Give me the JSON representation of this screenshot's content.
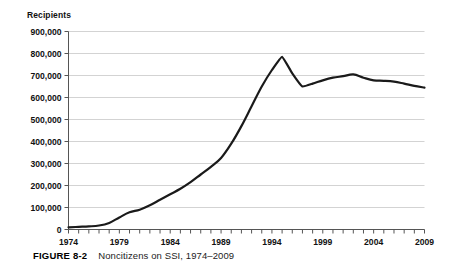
{
  "figure": {
    "caption_label": "FIGURE 8-2",
    "caption_text": "Noncitizens on SSI, 1974–2009"
  },
  "chart_data": {
    "type": "line",
    "title": "",
    "subtitle": "",
    "xlabel": "",
    "ylabel": "Recipients",
    "ylim": [
      0,
      900000
    ],
    "xlim": [
      1974,
      2009
    ],
    "grid": true,
    "grid_axis": "y",
    "legend": false,
    "legend_position": "none",
    "line_color": "#1a1a1a",
    "background_color": "#ffffff",
    "gridline_color": "#c8c8c8",
    "axis_color": "#555555",
    "y_ticks": [
      0,
      100000,
      200000,
      300000,
      400000,
      500000,
      600000,
      700000,
      800000,
      900000
    ],
    "y_tick_labels": [
      "0",
      "100,000",
      "200,000",
      "300,000",
      "400,000",
      "500,000",
      "600,000",
      "700,000",
      "800,000",
      "900,000"
    ],
    "x_ticks": [
      1974,
      1975,
      1976,
      1977,
      1978,
      1979,
      1980,
      1981,
      1982,
      1983,
      1984,
      1985,
      1986,
      1987,
      1988,
      1989,
      1990,
      1991,
      1992,
      1993,
      1994,
      1995,
      1996,
      1997,
      1998,
      1999,
      2000,
      2001,
      2002,
      2003,
      2004,
      2005,
      2006,
      2007,
      2008,
      2009
    ],
    "x_tick_labels_shown": [
      "1974",
      "1979",
      "1984",
      "1989",
      "1994",
      "1999",
      "2004",
      "2009"
    ],
    "x_tick_labels_shown_values": [
      1974,
      1979,
      1984,
      1989,
      1994,
      1999,
      2004,
      2009
    ],
    "x": [
      1974,
      1975,
      1976,
      1977,
      1978,
      1979,
      1980,
      1981,
      1982,
      1983,
      1984,
      1985,
      1986,
      1987,
      1988,
      1989,
      1990,
      1991,
      1992,
      1993,
      1994,
      1995,
      1996,
      1997,
      1998,
      1999,
      2000,
      2001,
      2002,
      2003,
      2004,
      2005,
      2006,
      2007,
      2008,
      2009
    ],
    "values": [
      10000,
      12000,
      14000,
      18000,
      30000,
      55000,
      78000,
      90000,
      110000,
      135000,
      160000,
      185000,
      215000,
      250000,
      285000,
      325000,
      390000,
      470000,
      560000,
      650000,
      725000,
      785000,
      710000,
      650000,
      663000,
      678000,
      690000,
      697000,
      705000,
      690000,
      678000,
      676000,
      672000,
      663000,
      653000,
      645000
    ],
    "series": [
      {
        "name": "Noncitizens on SSI",
        "values": [
          10000,
          12000,
          14000,
          18000,
          30000,
          55000,
          78000,
          90000,
          110000,
          135000,
          160000,
          185000,
          215000,
          250000,
          285000,
          325000,
          390000,
          470000,
          560000,
          650000,
          725000,
          785000,
          710000,
          650000,
          663000,
          678000,
          690000,
          697000,
          705000,
          690000,
          678000,
          676000,
          672000,
          663000,
          653000,
          645000
        ]
      }
    ],
    "annotations": []
  }
}
